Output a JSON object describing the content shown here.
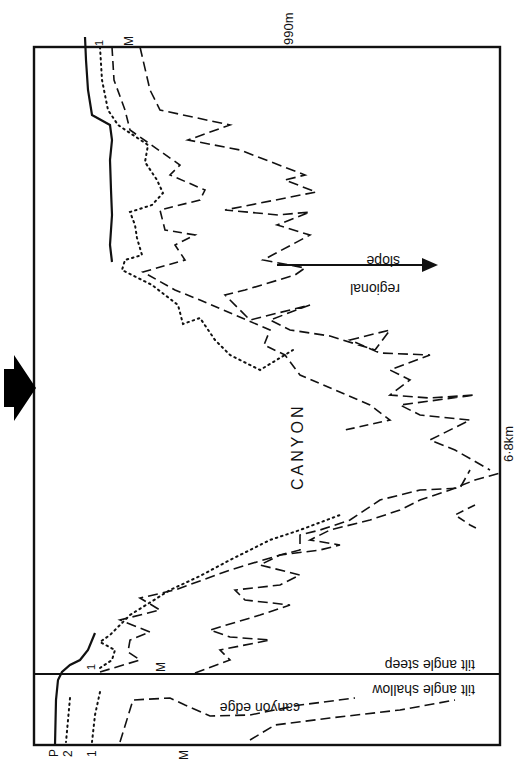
{
  "figure": {
    "type": "geological-cross-section",
    "orientation": "rotated",
    "labels": {
      "top_scale": "990m",
      "right_scale": "6·8km",
      "canyon": "CANYON",
      "regional_slope_1": "regional",
      "regional_slope_2": "slope",
      "tilt_steep": "tilt angle steep",
      "tilt_shallow": "tilt angle shallow",
      "canyon_edge": "canyon edge"
    },
    "horizon_labels_top": [
      "1",
      "M"
    ],
    "horizon_labels_bottom": [
      "P",
      "2",
      "1",
      "M"
    ],
    "horizon_labels_inner": [
      "1",
      "M"
    ],
    "legend_line_styles": {
      "P": "solid",
      "1": "dotted",
      "2": "dotted",
      "M": "dashed"
    },
    "colors": {
      "ink": "#111111",
      "background": "#ffffff"
    }
  }
}
